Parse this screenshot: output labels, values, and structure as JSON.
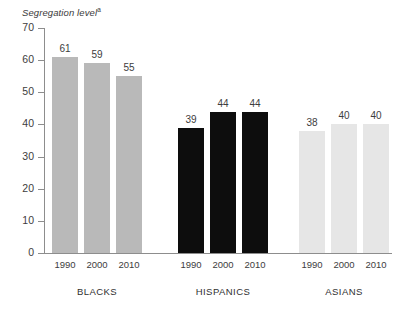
{
  "chart_data": {
    "type": "bar",
    "title": "Segregation level",
    "title_superscript": "a",
    "xlabel": "",
    "ylabel": "Segregation level",
    "ylim": [
      0,
      70
    ],
    "ytick_step": 10,
    "grid": false,
    "legend": "none",
    "categories": [
      "1990",
      "2000",
      "2010"
    ],
    "groups": [
      "BLACKS",
      "HISPANICS",
      "ASIANS"
    ],
    "series": [
      {
        "name": "BLACKS",
        "values": [
          61,
          59,
          55
        ],
        "color": "#b9b9b9"
      },
      {
        "name": "HISPANICS",
        "values": [
          39,
          44,
          44
        ],
        "color": "#0d0d0d"
      },
      {
        "name": "ASIANS",
        "values": [
          38,
          40,
          40
        ],
        "color": "#e6e6e6"
      }
    ],
    "ytick_labels": [
      "70",
      "60",
      "50",
      "40",
      "30",
      "20",
      "10",
      "0"
    ],
    "ytick_values": [
      70,
      60,
      50,
      40,
      30,
      20,
      10,
      0
    ],
    "axis_color": "#8d8d8d",
    "text_color": "#3d3d3d"
  },
  "axis": {
    "y_title": "Segregation level",
    "y_title_superscript": "a"
  },
  "footnote": "",
  "groups": [
    {
      "label": "BLACKS",
      "bars": [
        {
          "year": "1990",
          "value": 61,
          "value_label": "61"
        },
        {
          "year": "2000",
          "value": 59,
          "value_label": "59"
        },
        {
          "year": "2010",
          "value": 55,
          "value_label": "55"
        }
      ]
    },
    {
      "label": "HISPANICS",
      "bars": [
        {
          "year": "1990",
          "value": 39,
          "value_label": "39"
        },
        {
          "year": "2000",
          "value": 44,
          "value_label": "44"
        },
        {
          "year": "2010",
          "value": 44,
          "value_label": "44"
        }
      ]
    },
    {
      "label": "ASIANS",
      "bars": [
        {
          "year": "1990",
          "value": 38,
          "value_label": "38"
        },
        {
          "year": "2000",
          "value": 40,
          "value_label": "40"
        },
        {
          "year": "2010",
          "value": 40,
          "value_label": "40"
        }
      ]
    }
  ]
}
